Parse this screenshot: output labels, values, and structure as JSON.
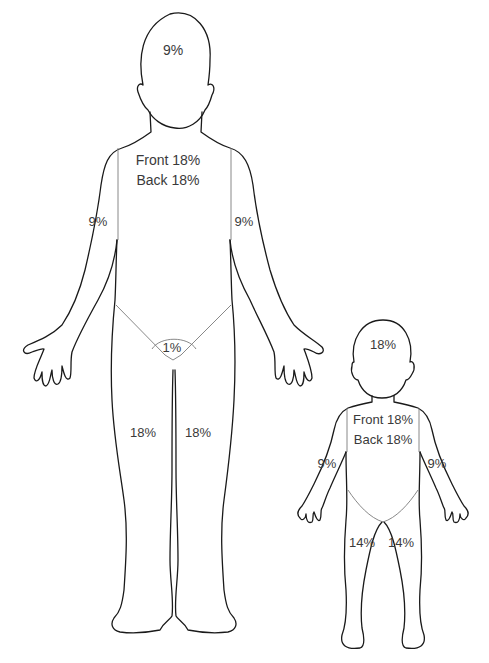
{
  "diagram": {
    "title": "",
    "type": "rule-of-nines body surface area chart",
    "adult": {
      "head": "9%",
      "trunk_front": "Front 18%",
      "trunk_back": "Back 18%",
      "left_arm": "9%",
      "right_arm": "9%",
      "perineum": "1%",
      "left_leg": "18%",
      "right_leg": "18%"
    },
    "child": {
      "head": "18%",
      "trunk_front": "Front 18%",
      "trunk_back": "Back 18%",
      "left_arm": "9%",
      "right_arm": "9%",
      "left_leg": "14%",
      "right_leg": "14%"
    },
    "colors": {
      "line": "#1a1a1a",
      "text": "#3a3a3a",
      "background": "#ffffff"
    }
  }
}
